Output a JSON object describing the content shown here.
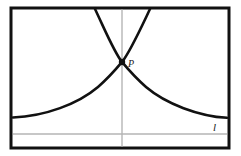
{
  "figure": {
    "title": "",
    "frame": {
      "x": 11,
      "y": 8,
      "width": 218,
      "height": 140,
      "stroke_color": "#111111",
      "stroke_width": 3
    },
    "labels": [
      {
        "id": "point-p",
        "text": "P",
        "x": 128,
        "y": 67,
        "style": "italic"
      },
      {
        "id": "line-l",
        "text": "l",
        "x": 213,
        "y": 131,
        "style": "italic"
      }
    ],
    "point": {
      "name": "P",
      "x": 122,
      "y": 62,
      "radius": 3.2,
      "color": "#111111"
    },
    "axis_lines": [
      {
        "id": "vertical-axis",
        "orientation": "vertical",
        "x1": 122,
        "y1": 9,
        "x2": 122,
        "y2": 147,
        "color": "#a8a8a8",
        "stroke_width": 1.2
      },
      {
        "id": "horizontal-asymptote-l",
        "orientation": "horizontal",
        "x1": 13,
        "y1": 134,
        "x2": 227,
        "y2": 134,
        "color": "#b5b5b5",
        "stroke_width": 1.6
      }
    ],
    "curves": [
      {
        "id": "increasing-exponential",
        "description": "y = a^x rising from left asymptote through P and exiting top edge",
        "color": "#111111",
        "stroke_width": 2.6,
        "path": "M 13 117.5 C 45 116.2, 78 104, 98 87 C 110 76.5, 117 68, 122 62 C 130 52, 140 30, 150 9"
      },
      {
        "id": "decreasing-exponential",
        "description": "y = a^-x falling from top edge through P toward right asymptote",
        "color": "#111111",
        "stroke_width": 2.6,
        "path": "M 95 9 C 105 30, 114 52, 122 62 C 127 68, 134 76.5, 146 87 C 166 104, 199 116.2, 227 117.8"
      }
    ],
    "colors": {
      "stroke": "#111111",
      "axis_gray": "#a8a8a8",
      "asymptote_gray": "#b5b5b5",
      "background": "#ffffff"
    }
  }
}
